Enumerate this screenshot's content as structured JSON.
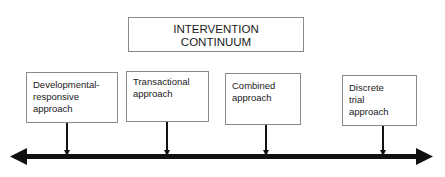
{
  "title": {
    "line1": "INTERVENTION",
    "line2": "CONTINUUM"
  },
  "nodes": [
    {
      "lines": [
        "Developmental-",
        "responsive",
        "approach"
      ]
    },
    {
      "lines": [
        "Transactional",
        "approach"
      ]
    },
    {
      "lines": [
        "Combined",
        "approach"
      ]
    },
    {
      "lines": [
        "Discrete",
        "trial",
        "approach"
      ]
    }
  ],
  "colors": {
    "line": "#111111",
    "border": "#8a8a8a"
  }
}
